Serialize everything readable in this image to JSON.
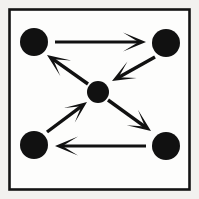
{
  "figure": {
    "canvas": {
      "width": 199,
      "height": 199
    },
    "background_color": "#f2f1ef",
    "panel_fill_color": "#fdfdfc",
    "ink_color": "#111111",
    "frame": {
      "label": "panel-border",
      "x": 9.5,
      "y": 9.5,
      "width": 180,
      "height": 180,
      "stroke_width": 2.6,
      "stroke_color": "#141414"
    },
    "nodes": [
      {
        "id": "top-left",
        "label": "Top left node",
        "cx": 34,
        "cy": 42,
        "r": 14,
        "color": "#111111"
      },
      {
        "id": "top-right",
        "label": "Top right node",
        "cx": 166,
        "cy": 43,
        "r": 14,
        "color": "#111111"
      },
      {
        "id": "center",
        "label": "Center node",
        "cx": 98,
        "cy": 92,
        "r": 11,
        "color": "#111111"
      },
      {
        "id": "bottom-left",
        "label": "Bottom left node",
        "cx": 34,
        "cy": 145,
        "r": 14,
        "color": "#111111"
      },
      {
        "id": "bottom-right",
        "label": "Bottom right node",
        "cx": 166,
        "cy": 146,
        "r": 14,
        "color": "#111111"
      }
    ],
    "edges": [
      {
        "id": "top-left-to-top-right",
        "label": "Arrow from top left node to top right node",
        "from": "top-left",
        "to": "top-right",
        "direction": "right",
        "orientation": "horizontal",
        "x1": 55,
        "y1": 42,
        "x2": 146,
        "y2": 42,
        "shaft_width": 3.0,
        "head_length": 23,
        "head_half_width": 9.5,
        "head_notch": 7.5
      },
      {
        "id": "top-right-to-center",
        "label": "Arrow from top right node to center node",
        "from": "top-right",
        "to": "center",
        "direction": "down-left",
        "orientation": "diagonal",
        "x1": 155,
        "y1": 57,
        "x2": 112,
        "y2": 81,
        "shaft_width": 3.4,
        "head_length": 23,
        "head_half_width": 9.5,
        "head_notch": 7.5
      },
      {
        "id": "center-to-top-left",
        "label": "Arrow from center node to top left node",
        "from": "center",
        "to": "top-left",
        "direction": "up-left",
        "orientation": "diagonal",
        "x1": 88,
        "y1": 84,
        "x2": 47,
        "y2": 55,
        "shaft_width": 3.4,
        "head_length": 23,
        "head_half_width": 9.5,
        "head_notch": 7.5
      },
      {
        "id": "bottom-left-to-center",
        "label": "Arrow from bottom left node to center node",
        "from": "bottom-left",
        "to": "center",
        "direction": "up-right",
        "orientation": "diagonal",
        "x1": 47,
        "y1": 132,
        "x2": 87,
        "y2": 102,
        "shaft_width": 3.4,
        "head_length": 22,
        "head_half_width": 9.0,
        "head_notch": 7.0
      },
      {
        "id": "center-to-bottom-right",
        "label": "Arrow from center node to bottom right node",
        "from": "center",
        "to": "bottom-right",
        "direction": "down-right",
        "orientation": "diagonal",
        "x1": 108,
        "y1": 100,
        "x2": 151,
        "y2": 131,
        "shaft_width": 3.4,
        "head_length": 23,
        "head_half_width": 9.5,
        "head_notch": 7.5
      },
      {
        "id": "bottom-right-to-bottom-left",
        "label": "Arrow from bottom right node to bottom left node",
        "from": "bottom-right",
        "to": "bottom-left",
        "direction": "left",
        "orientation": "horizontal",
        "x1": 146,
        "y1": 146,
        "x2": 55,
        "y2": 146,
        "shaft_width": 3.0,
        "head_length": 23,
        "head_half_width": 9.5,
        "head_notch": 7.5
      }
    ]
  }
}
